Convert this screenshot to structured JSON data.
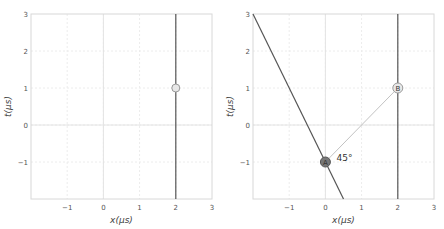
{
  "chart_data": [
    {
      "type": "line",
      "panel": "left",
      "xlabel": "x(μs)",
      "ylabel": "t(μs)",
      "xlim": [
        -2,
        3
      ],
      "ylim": [
        -2,
        3
      ],
      "xticks": [
        "−1",
        "0",
        "1",
        "2",
        "3"
      ],
      "yticks": [
        "−1",
        "0",
        "1",
        "2",
        "3"
      ],
      "grid": true,
      "series": [
        {
          "name": "worldline x=2",
          "points": [
            [
              2,
              -2
            ],
            [
              2,
              3
            ]
          ],
          "color": "#555555"
        }
      ],
      "markers": [
        {
          "label": "",
          "x": 2,
          "t": 1,
          "fill": "#e8e8e8",
          "stroke": "#999999"
        }
      ]
    },
    {
      "type": "line",
      "panel": "right",
      "xlabel": "x(μs)",
      "ylabel": "t(μs)",
      "xlim": [
        -2,
        3
      ],
      "ylim": [
        -2,
        3
      ],
      "xticks": [
        "−1",
        "0",
        "1",
        "2",
        "3"
      ],
      "yticks": [
        "−1",
        "0",
        "1",
        "2",
        "3"
      ],
      "grid": true,
      "series": [
        {
          "name": "steep worldline",
          "points": [
            [
              -2,
              3
            ],
            [
              0.5,
              -2
            ]
          ],
          "color": "#555555"
        },
        {
          "name": "worldline x=2",
          "points": [
            [
              2,
              -2
            ],
            [
              2,
              3
            ]
          ],
          "color": "#555555"
        },
        {
          "name": "light signal A→B",
          "points": [
            [
              0,
              -1
            ],
            [
              2,
              1
            ]
          ],
          "color": "#bbbbbb"
        }
      ],
      "markers": [
        {
          "label": "A",
          "x": 0,
          "t": -1,
          "fill": "#777777",
          "stroke": "#555555"
        },
        {
          "label": "B",
          "x": 2,
          "t": 1,
          "fill": "#e8e8e8",
          "stroke": "#999999"
        }
      ],
      "annotations": [
        {
          "text": "45°",
          "x": 0.25,
          "t": -1
        }
      ]
    }
  ]
}
